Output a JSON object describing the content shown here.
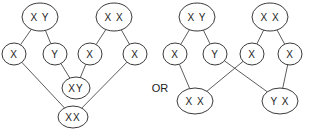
{
  "left_diagram": {
    "nodes": [
      {
        "id": "l_xy_top",
        "label": "X Y",
        "cx": 40,
        "cy": 17,
        "rx": 18,
        "ry": 14
      },
      {
        "id": "l_xx_top",
        "label": "X X",
        "cx": 114,
        "cy": 17,
        "rx": 18,
        "ry": 14
      },
      {
        "id": "l_x1",
        "label": "X",
        "cx": 14,
        "cy": 54,
        "rx": 12,
        "ry": 11
      },
      {
        "id": "l_y1",
        "label": "Y",
        "cx": 55,
        "cy": 54,
        "rx": 12,
        "ry": 11
      },
      {
        "id": "l_x2",
        "label": "X",
        "cx": 90,
        "cy": 54,
        "rx": 12,
        "ry": 11
      },
      {
        "id": "l_x3",
        "label": "X",
        "cx": 135,
        "cy": 54,
        "rx": 12,
        "ry": 11
      },
      {
        "id": "l_xy_mid",
        "label": "XY",
        "cx": 76,
        "cy": 88,
        "rx": 14,
        "ry": 11
      },
      {
        "id": "l_xx_bot",
        "label": "XX",
        "cx": 73,
        "cy": 117,
        "rx": 15,
        "ry": 11
      }
    ],
    "edges": [
      [
        "l_xy_top",
        "l_x1"
      ],
      [
        "l_xy_top",
        "l_y1"
      ],
      [
        "l_xx_top",
        "l_x2"
      ],
      [
        "l_xx_top",
        "l_x3"
      ],
      [
        "l_y1",
        "l_xy_mid"
      ],
      [
        "l_x2",
        "l_xy_mid"
      ],
      [
        "l_x1",
        "l_xx_bot"
      ],
      [
        "l_x3",
        "l_xx_bot"
      ]
    ]
  },
  "separator": {
    "label": "OR",
    "x": 160,
    "y": 88
  },
  "right_diagram": {
    "nodes": [
      {
        "id": "r_xy_top",
        "label": "X Y",
        "cx": 197,
        "cy": 17,
        "rx": 18,
        "ry": 14
      },
      {
        "id": "r_xx_top",
        "label": "X X",
        "cx": 270,
        "cy": 17,
        "rx": 18,
        "ry": 14
      },
      {
        "id": "r_x1",
        "label": "X",
        "cx": 175,
        "cy": 54,
        "rx": 12,
        "ry": 11
      },
      {
        "id": "r_y1",
        "label": "Y",
        "cx": 215,
        "cy": 54,
        "rx": 12,
        "ry": 11
      },
      {
        "id": "r_x2",
        "label": "X",
        "cx": 252,
        "cy": 54,
        "rx": 12,
        "ry": 11
      },
      {
        "id": "r_x3",
        "label": "X",
        "cx": 290,
        "cy": 54,
        "rx": 12,
        "ry": 11
      },
      {
        "id": "r_xx_bot",
        "label": "X X",
        "cx": 195,
        "cy": 101,
        "rx": 18,
        "ry": 13
      },
      {
        "id": "r_yx_bot",
        "label": "Y X",
        "cx": 280,
        "cy": 101,
        "rx": 18,
        "ry": 13
      }
    ],
    "edges": [
      [
        "r_xy_top",
        "r_x1"
      ],
      [
        "r_xy_top",
        "r_y1"
      ],
      [
        "r_xx_top",
        "r_x2"
      ],
      [
        "r_xx_top",
        "r_x3"
      ],
      [
        "r_x1",
        "r_xx_bot"
      ],
      [
        "r_x2",
        "r_xx_bot"
      ],
      [
        "r_y1",
        "r_yx_bot"
      ],
      [
        "r_x3",
        "r_yx_bot"
      ]
    ]
  }
}
